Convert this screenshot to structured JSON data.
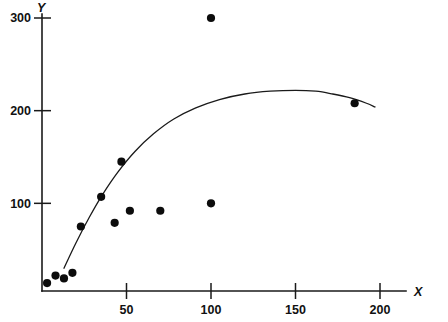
{
  "chart_data": {
    "type": "scatter",
    "title": "",
    "subtitle": "",
    "xlabel": "X",
    "ylabel": "Y",
    "xlim": [
      0,
      215
    ],
    "ylim": [
      0,
      318
    ],
    "grid": false,
    "legend": null,
    "x_ticks": [
      50,
      100,
      150,
      200
    ],
    "x_tick_labels": [
      "50",
      "100",
      "150",
      "200"
    ],
    "y_ticks": [
      100,
      200,
      300
    ],
    "y_tick_labels": [
      "100",
      "200",
      "300"
    ],
    "series": [
      {
        "name": "observations",
        "type": "scatter",
        "marker": "filled-circle",
        "color": "#0c0c0c",
        "points": [
          {
            "x": 3,
            "y": 14
          },
          {
            "x": 8,
            "y": 22
          },
          {
            "x": 13,
            "y": 19
          },
          {
            "x": 18,
            "y": 25
          },
          {
            "x": 23,
            "y": 75
          },
          {
            "x": 35,
            "y": 107
          },
          {
            "x": 43,
            "y": 79
          },
          {
            "x": 47,
            "y": 145
          },
          {
            "x": 52,
            "y": 92
          },
          {
            "x": 70,
            "y": 92
          },
          {
            "x": 100,
            "y": 100
          },
          {
            "x": 100,
            "y": 300
          },
          {
            "x": 185,
            "y": 208
          }
        ]
      },
      {
        "name": "fitted-curve",
        "type": "line",
        "color": "#1a1a1a",
        "points": [
          {
            "x": 13,
            "y": 30
          },
          {
            "x": 20,
            "y": 57
          },
          {
            "x": 28,
            "y": 85
          },
          {
            "x": 36,
            "y": 110
          },
          {
            "x": 45,
            "y": 134
          },
          {
            "x": 55,
            "y": 156
          },
          {
            "x": 66,
            "y": 175
          },
          {
            "x": 78,
            "y": 191
          },
          {
            "x": 91,
            "y": 203
          },
          {
            "x": 105,
            "y": 212
          },
          {
            "x": 120,
            "y": 218
          },
          {
            "x": 135,
            "y": 221
          },
          {
            "x": 150,
            "y": 222
          },
          {
            "x": 162,
            "y": 221
          },
          {
            "x": 172,
            "y": 218
          },
          {
            "x": 182,
            "y": 214
          },
          {
            "x": 192,
            "y": 208
          },
          {
            "x": 197,
            "y": 204
          }
        ]
      }
    ]
  },
  "axes": {
    "y_axis_title": "Y",
    "x_axis_title": "X"
  }
}
